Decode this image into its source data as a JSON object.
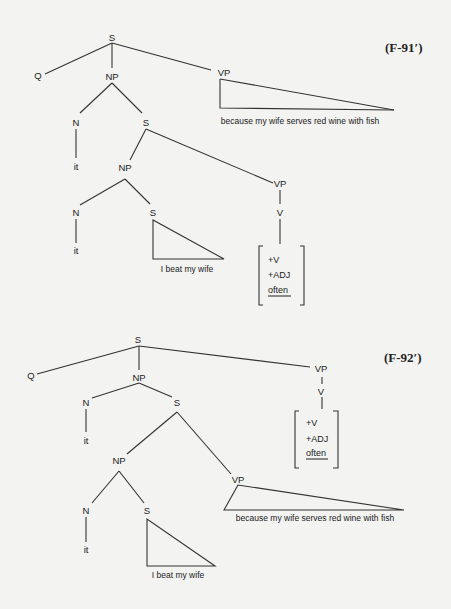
{
  "figures": [
    {
      "label": "(F-91′)",
      "nodes": {
        "root_s": "S",
        "q": "Q",
        "np": "NP",
        "vp_top": "VP",
        "vp_top_text": "because my wife serves red wine with fish",
        "np_n": "N",
        "np_s": "S",
        "n_it": "it",
        "inner_np": "NP",
        "inner_vp": "VP",
        "inner_n": "N",
        "inner_s": "S",
        "inner_it": "it",
        "inner_s_text": "I beat my wife",
        "v": "V",
        "features": [
          "+V",
          "+ADJ",
          "often"
        ]
      }
    },
    {
      "label": "(F-92′)",
      "nodes": {
        "root_s": "S",
        "q": "Q",
        "np": "NP",
        "vp_top": "VP",
        "v": "V",
        "features": [
          "+V",
          "+ADJ",
          "often"
        ],
        "np_n": "N",
        "np_s": "S",
        "n_it": "it",
        "inner_np": "NP",
        "inner_vp": "VP",
        "inner_vp_text": "because my wife serves red wine with fish",
        "inner_n": "N",
        "inner_s": "S",
        "inner_it": "it",
        "inner_s_text": "I beat my wife"
      }
    }
  ]
}
